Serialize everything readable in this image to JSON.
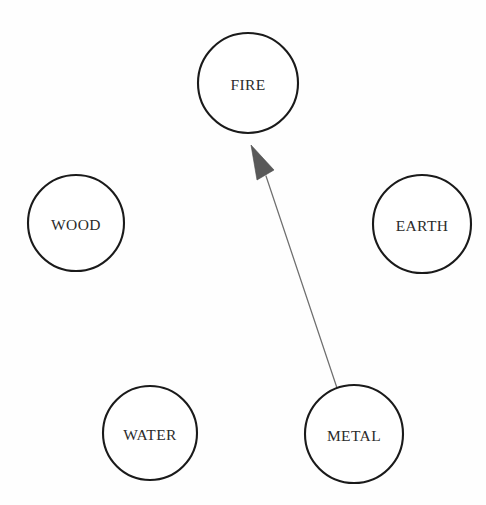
{
  "diagram": {
    "background_color": "#fefefe",
    "width": 486,
    "height": 505,
    "node_stroke_color": "#1a1a1a",
    "node_fill_color": "#ffffff",
    "label_color": "#2b2b2b",
    "edge_color": "#6f6f6f",
    "arrowhead_color": "#595959"
  },
  "nodes": [
    {
      "id": "fire",
      "label": "FIRE",
      "cx": 248,
      "cy": 83,
      "r": 50
    },
    {
      "id": "wood",
      "label": "WOOD",
      "cx": 76,
      "cy": 223,
      "r": 48
    },
    {
      "id": "earth",
      "label": "EARTH",
      "cx": 422,
      "cy": 224,
      "r": 49
    },
    {
      "id": "water",
      "label": "WATER",
      "cx": 150,
      "cy": 433,
      "r": 47
    },
    {
      "id": "metal",
      "label": "METAL",
      "cx": 354,
      "cy": 434,
      "r": 49
    }
  ],
  "edges": [
    {
      "id": "metal-to-fire",
      "from": "metal",
      "to": "fire",
      "label": "",
      "directed": true,
      "x1": 337,
      "y1": 388,
      "x2": 266,
      "y2": 176,
      "arrow_tip_x": 251,
      "arrow_tip_y": 145,
      "arrow_left_x": 257,
      "arrow_left_y": 180,
      "arrow_right_x": 274,
      "arrow_right_y": 170
    }
  ]
}
